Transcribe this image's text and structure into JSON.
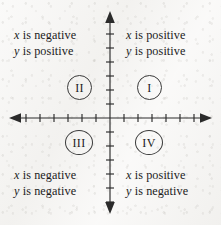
{
  "figure": {
    "background_color": "#f5f4f2",
    "ink_color": "#1c1c1c"
  },
  "axes": {
    "x_axis_name": "horizontal axis",
    "y_axis_name": "vertical axis",
    "origin": {
      "x": 110,
      "y": 118
    },
    "x_range": [
      10,
      211
    ],
    "y_range": [
      12,
      213
    ],
    "tick_spacing": 14,
    "tick_count_x": 13,
    "tick_count_y": 13,
    "arrowheads": [
      "left",
      "right",
      "up",
      "down"
    ]
  },
  "quadrants": [
    {
      "id": "I",
      "numeral": "I",
      "position": "top-right",
      "x_sign_text": "x is positive",
      "y_sign_text": "y is positive",
      "x_variable": "x",
      "y_variable": "y",
      "x_sign_word": "is positive",
      "y_sign_word": "is positive"
    },
    {
      "id": "II",
      "numeral": "II",
      "position": "top-left",
      "x_sign_text": "x is negative",
      "y_sign_text": "y is positive",
      "x_variable": "x",
      "y_variable": "y",
      "x_sign_word": "is negative",
      "y_sign_word": "is positive"
    },
    {
      "id": "III",
      "numeral": "III",
      "position": "bottom-left",
      "x_sign_text": "x is negative",
      "y_sign_text": "y is negative",
      "x_variable": "x",
      "y_variable": "y",
      "x_sign_word": "is negative",
      "y_sign_word": "is negative"
    },
    {
      "id": "IV",
      "numeral": "IV",
      "position": "bottom-right",
      "x_sign_text": "x is positive",
      "y_sign_text": "y is negative",
      "x_variable": "x",
      "y_variable": "y",
      "x_sign_word": "is positive",
      "y_sign_word": "is negative"
    }
  ]
}
